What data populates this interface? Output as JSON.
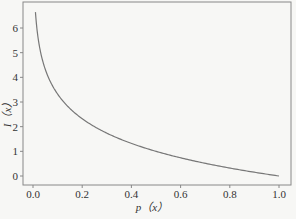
{
  "chart_data": {
    "type": "line",
    "title": "",
    "xlabel": "p（x）",
    "ylabel": "I（x）",
    "xlim": [
      0.0,
      1.0
    ],
    "ylim": [
      0,
      6.64
    ],
    "xticks": [
      "0.0",
      "0.2",
      "0.4",
      "0.6",
      "0.8",
      "1.0"
    ],
    "yticks": [
      "0",
      "1",
      "2",
      "3",
      "4",
      "5",
      "6"
    ],
    "grid": false,
    "legend": null,
    "series": [
      {
        "name": "I(x) = -log2 p(x)",
        "color": "#777777",
        "x": [
          0.01,
          0.02,
          0.03,
          0.05,
          0.08,
          0.1,
          0.15,
          0.2,
          0.3,
          0.4,
          0.5,
          0.6,
          0.7,
          0.8,
          0.9,
          1.0
        ],
        "y": [
          6.64,
          5.64,
          5.06,
          4.32,
          3.64,
          3.32,
          2.74,
          2.32,
          1.74,
          1.32,
          1.0,
          0.74,
          0.51,
          0.32,
          0.15,
          0.0
        ]
      }
    ]
  }
}
